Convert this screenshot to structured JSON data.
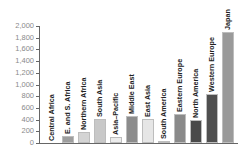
{
  "chart_data": {
    "type": "bar",
    "title": "",
    "xlabel": "",
    "ylabel": "",
    "ylim": [
      0,
      2000
    ],
    "yticks": [
      0,
      200,
      400,
      600,
      800,
      1000,
      1200,
      1400,
      1600,
      1800,
      2000
    ],
    "ytick_labels": [
      "0",
      "200",
      "400",
      "600",
      "800",
      "1,000",
      "1,200",
      "1,400",
      "1,600",
      "1,800",
      "2,000"
    ],
    "grid": false,
    "legend": null,
    "label_position": "rotated above bars",
    "categories": [
      "Central Africa",
      "E. and S. Africa",
      "Northern Africa",
      "South Asia",
      "Asia–Pacific",
      "Middle East",
      "East Asia",
      "South America",
      "Eastern Europe",
      "North America",
      "Western Europe",
      "Japan"
    ],
    "values": [
      0,
      120,
      190,
      410,
      100,
      465,
      410,
      30,
      500,
      400,
      845,
      1900
    ],
    "colors": [
      "#9e9e9e",
      "#9e9e9e",
      "#d4d4d4",
      "#c8c8c8",
      "#ececec",
      "#8c8c8c",
      "#e6e6e6",
      "#bdbdbd",
      "#8a8a8a",
      "#4a4a4a",
      "#4f4f4f",
      "#9a9a9a"
    ]
  }
}
